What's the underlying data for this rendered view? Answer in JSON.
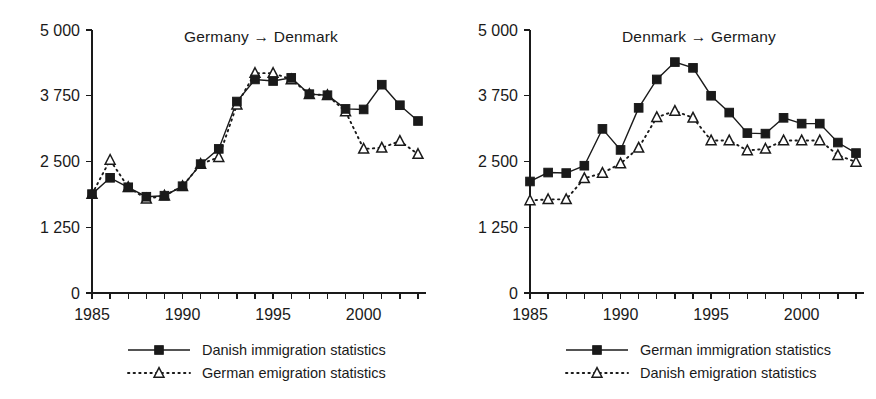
{
  "figure": {
    "width": 876,
    "height": 399,
    "background": "#ffffff",
    "ink_color": "#1a1a1a"
  },
  "chart_data": [
    {
      "id": "germany-to-denmark",
      "type": "line",
      "title": "Germany → Denmark",
      "xlabel": "",
      "ylabel": "",
      "xlim": [
        1985,
        2003
      ],
      "ylim": [
        0,
        5000
      ],
      "ytick_values": [
        0,
        1250,
        2500,
        3750,
        5000
      ],
      "ytick_labels": [
        "0",
        "1 250",
        "2 500",
        "3 750",
        "5 000"
      ],
      "xtick_values": [
        1985,
        1986,
        1987,
        1988,
        1989,
        1990,
        1991,
        1992,
        1993,
        1994,
        1995,
        1996,
        1997,
        1998,
        1999,
        2000,
        2001,
        2002,
        2003
      ],
      "xtick_labels_shown": [
        "1985",
        "1990",
        "1995",
        "2000"
      ],
      "xtick_labels_shown_values": [
        1985,
        1990,
        1995,
        2000
      ],
      "grid": false,
      "legend_position": "below",
      "x": [
        1985,
        1986,
        1987,
        1988,
        1989,
        1990,
        1991,
        1992,
        1993,
        1994,
        1995,
        1996,
        1997,
        1998,
        1999,
        2000,
        2001,
        2002,
        2003
      ],
      "series": [
        {
          "name": "Danish immigration statistics",
          "marker": "filled-square",
          "line": "solid",
          "values": [
            1880,
            2190,
            2010,
            1830,
            1850,
            2030,
            2450,
            2740,
            3640,
            4060,
            4030,
            4090,
            3780,
            3760,
            3500,
            3490,
            3960,
            3570,
            3270
          ]
        },
        {
          "name": "German emigration statistics",
          "marker": "open-triangle",
          "line": "dotted",
          "values": [
            1880,
            2530,
            2010,
            1790,
            1850,
            2030,
            2450,
            2580,
            3580,
            4180,
            4180,
            4060,
            3780,
            3760,
            3450,
            2740,
            2760,
            2890,
            2640
          ]
        }
      ]
    },
    {
      "id": "denmark-to-germany",
      "type": "line",
      "title": "Denmark → Germany",
      "xlabel": "",
      "ylabel": "",
      "xlim": [
        1985,
        2003
      ],
      "ylim": [
        0,
        5000
      ],
      "ytick_values": [
        0,
        1250,
        2500,
        3750,
        5000
      ],
      "ytick_labels": [
        "0",
        "1 250",
        "2 500",
        "3 750",
        "5 000"
      ],
      "xtick_values": [
        1985,
        1986,
        1987,
        1988,
        1989,
        1990,
        1991,
        1992,
        1993,
        1994,
        1995,
        1996,
        1997,
        1998,
        1999,
        2000,
        2001,
        2002,
        2003
      ],
      "xtick_labels_shown": [
        "1985",
        "1990",
        "1995",
        "2000"
      ],
      "xtick_labels_shown_values": [
        1985,
        1990,
        1995,
        2000
      ],
      "grid": false,
      "legend_position": "below",
      "x": [
        1985,
        1986,
        1987,
        1988,
        1989,
        1990,
        1991,
        1992,
        1993,
        1994,
        1995,
        1996,
        1997,
        1998,
        1999,
        2000,
        2001,
        2002,
        2003
      ],
      "series": [
        {
          "name": "German immigration statistics",
          "marker": "filled-square",
          "line": "solid",
          "values": [
            2120,
            2290,
            2280,
            2420,
            3120,
            2720,
            3520,
            4060,
            4390,
            4280,
            3750,
            3430,
            3040,
            3030,
            3330,
            3220,
            3220,
            2860,
            2660
          ]
        },
        {
          "name": "Danish emigration statistics",
          "marker": "open-triangle",
          "line": "dotted",
          "values": [
            1760,
            1780,
            1780,
            2180,
            2280,
            2460,
            2760,
            3340,
            3460,
            3330,
            2900,
            2900,
            2710,
            2740,
            2900,
            2900,
            2900,
            2620,
            2490
          ]
        }
      ]
    }
  ],
  "panels": [
    {
      "key": "left",
      "title": "Germany → Denmark",
      "legend": [
        {
          "label": "Danish immigration statistics",
          "style": "solid-square"
        },
        {
          "label": "German emigration statistics",
          "style": "dotted-triangle"
        }
      ]
    },
    {
      "key": "right",
      "title": "Denmark → Germany",
      "legend": [
        {
          "label": "German immigration statistics",
          "style": "solid-square"
        },
        {
          "label": "Danish emigration statistics",
          "style": "dotted-triangle"
        }
      ]
    }
  ]
}
